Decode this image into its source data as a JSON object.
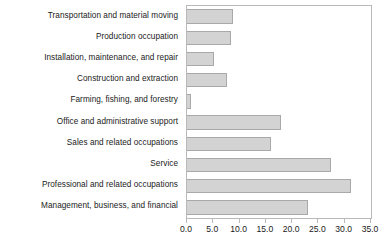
{
  "chart_data": {
    "type": "bar",
    "orientation": "horizontal",
    "title": "",
    "xlabel": "",
    "ylabel": "",
    "xlim": [
      0.0,
      35.0
    ],
    "grid": false,
    "legend": null,
    "xticks": [
      "0.0",
      "5.0",
      "10.0",
      "15.0",
      "20.0",
      "25.0",
      "30.0",
      "35.0"
    ],
    "xtick_values": [
      0.0,
      5.0,
      10.0,
      15.0,
      20.0,
      25.0,
      30.0,
      35.0
    ],
    "categories": [
      "Transportation and material moving",
      "Production occupation",
      "Installation, maintenance, and repair",
      "Construction and extraction",
      "Farming, fishing, and forestry",
      "Office and administrative support",
      "Sales and related occupations",
      "Service",
      "Professional and related occupations",
      "Management, business, and financial"
    ],
    "values": [
      8.7,
      8.4,
      5.1,
      7.6,
      0.7,
      17.8,
      16.0,
      27.4,
      31.2,
      23.0
    ],
    "colors": {
      "bar_fill": "#d3d3d3",
      "bar_edge": "#a9a9a9",
      "axis": "#b9b9b9",
      "text": "#1a1a1a"
    }
  }
}
